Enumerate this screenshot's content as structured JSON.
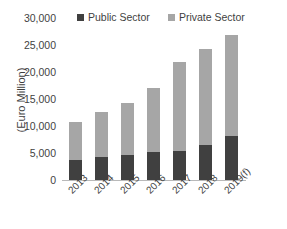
{
  "chart_data": {
    "type": "bar",
    "title": "",
    "subtitle": "",
    "xlabel": "",
    "ylabel": "(Euro Million)",
    "categories": [
      "2013",
      "2014",
      "2015",
      "2016",
      "2017",
      "2018",
      "2019(f)"
    ],
    "series": [
      {
        "name": "Public Sector",
        "color": "#404040",
        "values": [
          3700,
          4300,
          4700,
          5200,
          5400,
          6500,
          8100
        ]
      },
      {
        "name": "Private Sector",
        "color": "#a6a6a6",
        "values": [
          7000,
          8300,
          9600,
          11800,
          16500,
          17800,
          18800
        ]
      }
    ],
    "totals": [
      10700,
      12600,
      14300,
      17000,
      21900,
      24300,
      26900
    ],
    "stacked": true,
    "ylim": [
      0,
      30000
    ],
    "yticks": [
      0,
      5000,
      10000,
      15000,
      20000,
      25000,
      30000
    ],
    "ytick_labels": [
      "0",
      "5,000",
      "10,000",
      "15,000",
      "20,000",
      "25,000",
      "30,000"
    ],
    "grid": false,
    "legend_position": "top",
    "background_color": "#ffffff"
  },
  "legend": {
    "items": [
      {
        "label": "Public Sector",
        "color": "#404040"
      },
      {
        "label": "Private Sector",
        "color": "#a6a6a6"
      }
    ]
  }
}
